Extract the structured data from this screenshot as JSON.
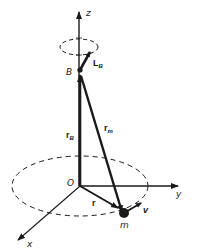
{
  "figure": {
    "axes": {
      "z_label": "z",
      "y_label": "y",
      "x_label": "x"
    },
    "points": {
      "origin_label": "O",
      "body_point_label": "B",
      "mass_label": "m"
    },
    "vectors": {
      "angular_momentum": {
        "main": "L",
        "sub": "B"
      },
      "r_B": {
        "main": "r",
        "sub": "B"
      },
      "r_m": {
        "main": "r",
        "sub": "m"
      },
      "r": {
        "main": "r"
      },
      "v": {
        "main": "v"
      }
    },
    "colors": {
      "ink": "#1a1a1a",
      "background": "#ffffff"
    }
  }
}
